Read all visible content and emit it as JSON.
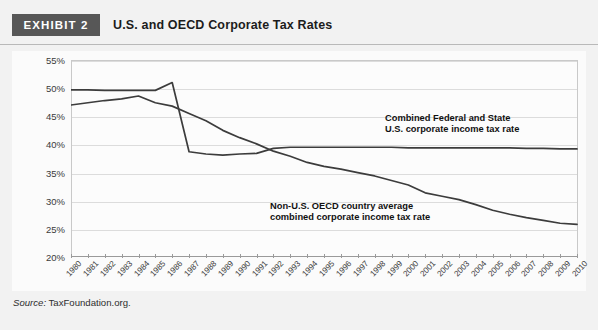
{
  "header": {
    "badge": "EXHIBIT 2",
    "title": "U.S. and OECD Corporate Tax Rates"
  },
  "source": {
    "keyword": "Source:",
    "text": " TaxFoundation.org."
  },
  "annotations": {
    "us_line1": "Combined Federal and State",
    "us_line2": "U.S. corporate income tax rate",
    "oecd_line1": "Non-U.S. OECD country average",
    "oecd_line2": "combined corporate income tax rate"
  },
  "colors": {
    "line": "#3c3c3c",
    "badge_bg": "#575757",
    "grid": "#dcdcdc",
    "page_bg": "#f2f2f2",
    "plot_bg": "#fcfcfc"
  },
  "chart_data": {
    "type": "line",
    "title": "U.S. and OECD Corporate Tax Rates",
    "xlabel": "",
    "ylabel": "",
    "ylim": [
      20,
      55
    ],
    "ytick_labels": [
      "20%",
      "25%",
      "30%",
      "35%",
      "40%",
      "45%",
      "50%",
      "55%"
    ],
    "ytick_values": [
      20,
      25,
      30,
      35,
      40,
      45,
      50,
      55
    ],
    "grid": true,
    "legend_position": "inline-annotations",
    "categories": [
      "1980",
      "1981",
      "1982",
      "1983",
      "1984",
      "1985",
      "1986",
      "1987",
      "1988",
      "1989",
      "1990",
      "1991",
      "1992",
      "1993",
      "1994",
      "1995",
      "1996",
      "1997",
      "1998",
      "1999",
      "2000",
      "2001",
      "2002",
      "2003",
      "2004",
      "2005",
      "2006",
      "2007",
      "2008",
      "2009",
      "2010"
    ],
    "series": [
      {
        "name": "Combined Federal and State U.S. corporate income tax rate",
        "values": [
          49.7,
          49.7,
          49.6,
          49.6,
          49.6,
          49.6,
          51.0,
          38.7,
          38.3,
          38.1,
          38.3,
          38.4,
          39.3,
          39.5,
          39.5,
          39.5,
          39.5,
          39.5,
          39.5,
          39.5,
          39.4,
          39.4,
          39.4,
          39.4,
          39.4,
          39.4,
          39.4,
          39.3,
          39.3,
          39.2,
          39.2
        ]
      },
      {
        "name": "Non-U.S. OECD country average combined corporate income tax rate",
        "values": [
          47.0,
          47.4,
          47.8,
          48.1,
          48.6,
          47.4,
          46.8,
          45.5,
          44.2,
          42.5,
          41.2,
          40.1,
          38.8,
          37.9,
          36.8,
          36.1,
          35.6,
          35.0,
          34.4,
          33.6,
          32.8,
          31.4,
          30.8,
          30.2,
          29.3,
          28.3,
          27.6,
          27.0,
          26.5,
          26.0,
          25.8
        ]
      }
    ]
  }
}
